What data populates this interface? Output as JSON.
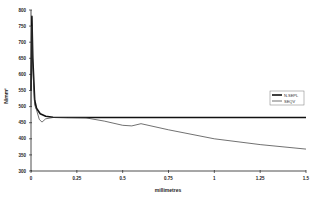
{
  "chart_data": {
    "type": "line",
    "title": "",
    "xlabel": "millimetres",
    "ylabel": "N/mm²",
    "xlim": [
      0,
      1.5
    ],
    "ylim": [
      300,
      800
    ],
    "x_ticks": [
      "0",
      "0.25",
      "0.5",
      "0.75",
      "1",
      "1.25",
      "1.5"
    ],
    "y_ticks": [
      "800",
      "750",
      "700",
      "650",
      "600",
      "550",
      "500",
      "450",
      "400",
      "350",
      "300"
    ],
    "grid": false,
    "legend_position": "right",
    "series": [
      {
        "name": "N.SEPL",
        "style": "thick",
        "color": "#111111",
        "x": [
          0,
          0.005,
          0.01,
          0.02,
          0.03,
          0.05,
          0.08,
          0.12,
          0.2,
          0.3,
          0.5,
          0.75,
          1.0,
          1.25,
          1.5
        ],
        "y": [
          550,
          780,
          650,
          520,
          495,
          478,
          470,
          467,
          466,
          466,
          466,
          466,
          466,
          466,
          466
        ]
      },
      {
        "name": "SEQV",
        "style": "thin",
        "color": "#333333",
        "x": [
          0,
          0.005,
          0.01,
          0.02,
          0.03,
          0.045,
          0.06,
          0.08,
          0.12,
          0.2,
          0.3,
          0.4,
          0.5,
          0.55,
          0.6,
          0.75,
          1.0,
          1.25,
          1.5
        ],
        "y": [
          500,
          750,
          620,
          505,
          490,
          460,
          452,
          462,
          466,
          466,
          465,
          455,
          442,
          440,
          447,
          428,
          400,
          382,
          368
        ]
      }
    ]
  },
  "legend": {
    "items": [
      {
        "label": "N.SEPL"
      },
      {
        "label": "SEQV"
      }
    ]
  }
}
